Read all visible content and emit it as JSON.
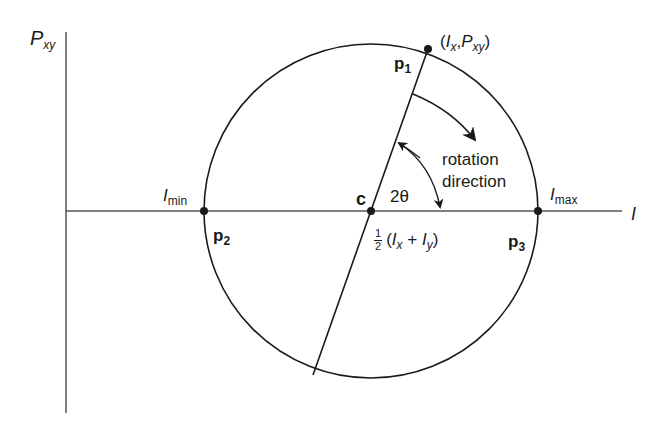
{
  "diagram": {
    "axes": {
      "vertical_label": "P",
      "vertical_sub": "xy",
      "horizontal_label": "I"
    },
    "points": {
      "p1": {
        "name": "p",
        "sub": "1",
        "coord_label_open": "(",
        "coord_I": "I",
        "coord_I_sub": "x",
        "coord_sep": ",",
        "coord_P": "P",
        "coord_P_sub": "xy",
        "coord_close": ")"
      },
      "p2": {
        "name": "p",
        "sub": "2",
        "axis_label": "I",
        "axis_sub": "min"
      },
      "p3": {
        "name": "p",
        "sub": "3",
        "axis_label": "I",
        "axis_sub": "max"
      },
      "c": {
        "name": "c",
        "frac_num": "1",
        "frac_den": "2",
        "expr_open": "(",
        "Ix": "I",
        "Ix_sub": "x",
        "plus": " + ",
        "Iy": "I",
        "Iy_sub": "y",
        "expr_close": ")"
      }
    },
    "angle_label": "2θ",
    "rotation_label_line1": "rotation",
    "rotation_label_line2": "direction",
    "colors": {
      "line": "#1a1a1a",
      "axis": "#555555",
      "background": "#ffffff"
    }
  }
}
